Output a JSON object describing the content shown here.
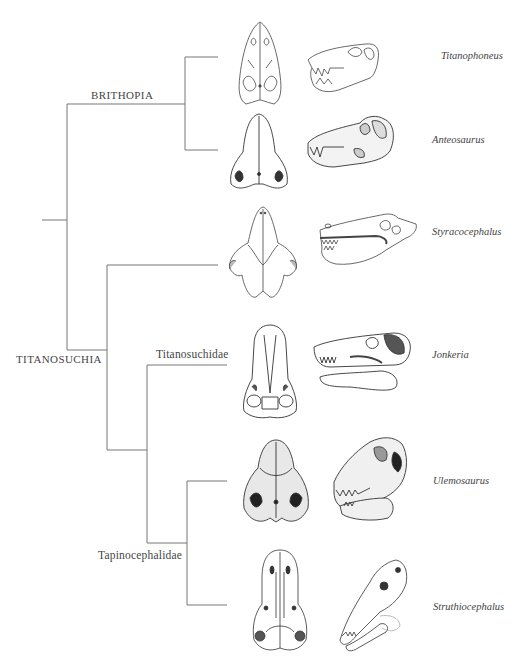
{
  "figure": {
    "type": "cladogram"
  },
  "clades": {
    "brithopia": "BRITHOPIA",
    "titanosuchia": "TITANOSUCHIA",
    "titanosuchidae": "Titanosuchidae",
    "tapinocephalidae": "Tapinocephalidae"
  },
  "taxa": [
    {
      "name": "Titanophoneus",
      "views": [
        "dorsal",
        "lateral"
      ]
    },
    {
      "name": "Anteosaurus",
      "views": [
        "dorsal",
        "lateral"
      ]
    },
    {
      "name": "Styracocephalus",
      "views": [
        "dorsal",
        "lateral"
      ]
    },
    {
      "name": "Jonkeria",
      "views": [
        "dorsal",
        "lateral"
      ]
    },
    {
      "name": "Ulemosaurus",
      "views": [
        "dorsal",
        "lateral"
      ]
    },
    {
      "name": "Struthiocephalus",
      "views": [
        "dorsal",
        "lateral"
      ]
    }
  ],
  "topology": "((Titanophoneus, Anteosaurus)Brithopia, (Styracocephalus, (Jonkeria Titanosuchidae, (Ulemosaurus, Struthiocephalus)Tapinocephalidae))Titanosuchia)",
  "colors": {
    "line": "#777777",
    "text": "#444444",
    "ink": "#333333"
  }
}
